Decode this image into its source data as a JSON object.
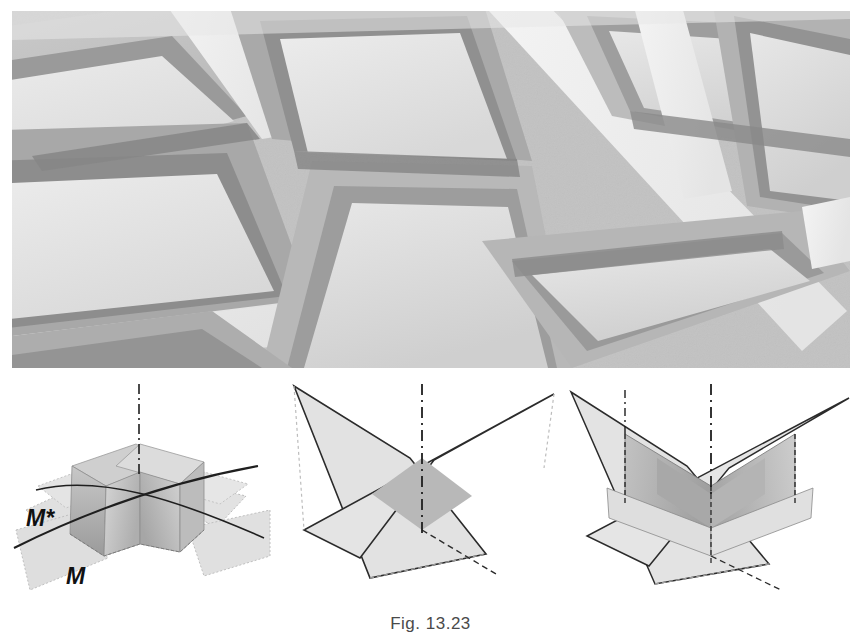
{
  "figure": {
    "caption": "Fig. 13.23",
    "photo": {
      "name": "coffered-ceiling-photograph",
      "description": "Grayscale photograph of a coffered ceiling grid viewed from below",
      "alt": "Recessed square ceiling panels separated by bright ribs"
    }
  },
  "diagrams": [
    {
      "id": "diagram-1",
      "name": "mirror-planes-with-folded-solid",
      "labels": [
        {
          "text": "M*",
          "name": "mirror-plane-label-m-star"
        },
        {
          "text": "M",
          "name": "mirror-plane-label-m"
        }
      ],
      "axis": "vertical-dash-dot-axis"
    },
    {
      "id": "diagram-2",
      "name": "two-intersecting-mirror-planes",
      "labels": [],
      "axis": "vertical-dash-dot-axis"
    },
    {
      "id": "diagram-3",
      "name": "intersecting-planes-with-vertical-folds",
      "labels": [],
      "axis": "vertical-dash-dot-axis"
    }
  ],
  "colors": {
    "page_background": "#ffffff",
    "photo_light_panel": "#e3e3e3",
    "photo_mid_panel": "#c4c4c4",
    "photo_dark_rib": "#8f8f8f",
    "photo_bright_rib": "#f2f2f2",
    "diagram_plane_fill": "#dcdcdc",
    "diagram_plane_fill_dark": "#b4b4b4",
    "diagram_solid_face": "#c9c9c9",
    "diagram_solid_shade": "#9e9e9e",
    "diagram_outline": "#2b2b2b",
    "caption_text": "#4a4a4a"
  }
}
